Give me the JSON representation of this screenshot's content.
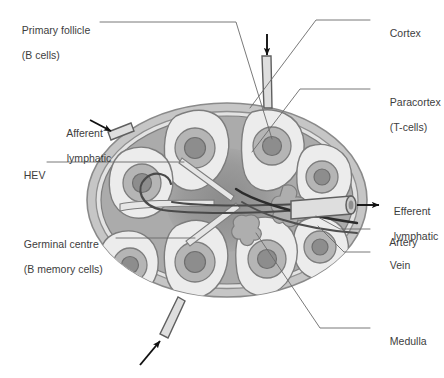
{
  "figure": {
    "type": "anatomical-diagram",
    "palette": {
      "background": "#ffffff",
      "capsule_outer": "#b4b4b4",
      "capsule_inner": "#d2d2d2",
      "subcapsular_sinus": "#e9e9e9",
      "cortex_light": "#ededed",
      "paracortex": "#a9a9a9",
      "medulla": "#9a9a9a",
      "medulla_core": "#8d8d8d",
      "follicle_ring": "#b8b8b8",
      "germinal_centre": "#8f8f8f",
      "vessel_fill": "#dcdcdc",
      "outline": "#6e6e6e",
      "arrow": "#111111",
      "leader_line": "#555555",
      "text": "#3d3d3d"
    }
  },
  "labels": {
    "primary_follicle": {
      "line1": "Primary follicle",
      "line2": "(B cells)"
    },
    "afferent_lymphatic": {
      "line1": "Afferent",
      "line2": "lymphatic"
    },
    "hev": {
      "line1": "HEV"
    },
    "germinal_centre": {
      "line1": "Germinal centre",
      "line2": "(B memory cells)"
    },
    "cortex": {
      "line1": "Cortex"
    },
    "paracortex": {
      "line1": "Paracortex",
      "line2": "(T-cells)"
    },
    "efferent_lymphatic": {
      "line1": "Efferent",
      "line2": "lymphatic"
    },
    "artery": {
      "line1": "Artery"
    },
    "vein": {
      "line1": "Vein"
    },
    "medulla": {
      "line1": "Medulla"
    }
  },
  "annotations": {
    "afferent_arrow_count": 3,
    "efferent_arrow_count": 1,
    "follicle_count": 7
  }
}
